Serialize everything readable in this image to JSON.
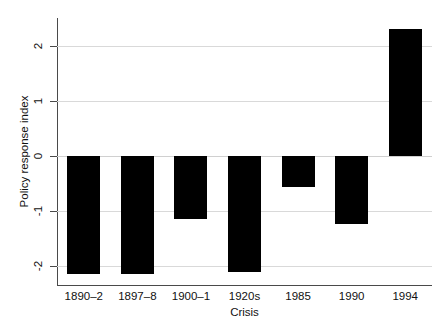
{
  "chart_data": {
    "type": "bar",
    "title": "",
    "xlabel": "Crisis",
    "ylabel": "Policy response index",
    "categories": [
      "1890–2",
      "1897–8",
      "1900–1",
      "1920s",
      "1985",
      "1990",
      "1994"
    ],
    "values": [
      -2.15,
      -2.15,
      -1.15,
      -2.12,
      -0.57,
      -1.25,
      2.3
    ],
    "series": [
      {
        "name": "Policy response index",
        "values": [
          -2.15,
          -2.15,
          -1.15,
          -2.12,
          -0.57,
          -1.25,
          2.3
        ]
      }
    ],
    "ylim": [
      -2.35,
      2.5
    ],
    "yticks": [
      2,
      1,
      0,
      -1,
      -2
    ],
    "ytick_labels": [
      "2",
      "1",
      "0",
      "-1",
      "-2"
    ],
    "grid": true,
    "grid_axis": "y",
    "legend": false,
    "bar_color": "#000000",
    "grid_color": "#d9d9d9",
    "axis_color": "#4a4a4a",
    "background": "#ffffff"
  }
}
